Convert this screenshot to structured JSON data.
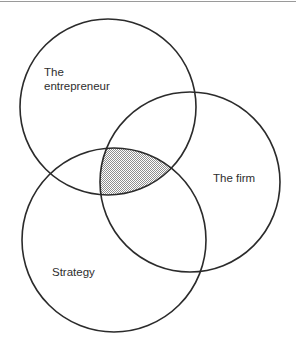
{
  "figure": {
    "type": "venn-diagram",
    "name": "three-circle-venn-diagram",
    "background_color": "#ffffff",
    "stroke_color": "#2b2b2b",
    "shaded_fill_color": "#c8c8c8",
    "top_rule_color": "#9a9a9a",
    "width": 296,
    "height": 347,
    "sets": [
      {
        "id": "entrepreneur",
        "label_lines": [
          "The",
          "entrepreneur"
        ],
        "label_x": 44,
        "label_y": 76,
        "cx": 108,
        "cy": 107,
        "r": 88
      },
      {
        "id": "firm",
        "label_lines": [
          "The firm"
        ],
        "label_x": 213,
        "label_y": 182,
        "cx": 190,
        "cy": 182,
        "r": 90
      },
      {
        "id": "strategy",
        "label_lines": [
          "Strategy"
        ],
        "label_x": 52,
        "label_y": 276,
        "cx": 114,
        "cy": 240,
        "r": 92
      }
    ],
    "shaded_region": {
      "name": "triple-intersection",
      "sets": [
        "entrepreneur",
        "firm",
        "strategy"
      ],
      "label": ""
    }
  }
}
